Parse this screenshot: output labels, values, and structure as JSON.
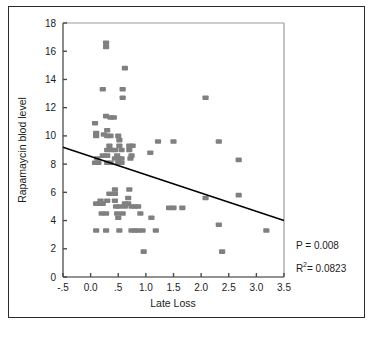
{
  "figure": {
    "frame_color": "#2b2b2b",
    "background": "#ffffff"
  },
  "chart_data": {
    "type": "scatter",
    "title": "",
    "xlabel": "Late Loss",
    "ylabel": "Rapamaycin blod level",
    "xlim": [
      -0.5,
      3.5
    ],
    "ylim": [
      0,
      18
    ],
    "grid": false,
    "legend": null,
    "marker_color": "#808080",
    "marker_shape": "square",
    "xticks": [
      -0.5,
      0.0,
      0.5,
      1.0,
      1.5,
      2.0,
      2.5,
      3.0,
      3.5
    ],
    "xtick_labels": [
      "-.5",
      "0.0",
      ".5",
      "1.0",
      "1.5",
      "2.0",
      "2.5",
      "3.0",
      "3.5"
    ],
    "yticks": [
      0,
      2,
      4,
      6,
      8,
      10,
      12,
      14,
      16,
      18
    ],
    "ytick_labels": [
      "0",
      "2",
      "4",
      "6",
      "8",
      "10",
      "12",
      "14",
      "16",
      "18"
    ],
    "points": [
      [
        0.28,
        16.6
      ],
      [
        0.28,
        16.3
      ],
      [
        0.62,
        14.8
      ],
      [
        0.22,
        13.3
      ],
      [
        0.58,
        13.3
      ],
      [
        0.58,
        12.7
      ],
      [
        2.08,
        12.7
      ],
      [
        0.28,
        11.4
      ],
      [
        0.36,
        11.3
      ],
      [
        0.42,
        11.3
      ],
      [
        0.08,
        10.9
      ],
      [
        0.3,
        10.4
      ],
      [
        0.1,
        10.2
      ],
      [
        0.24,
        10.1
      ],
      [
        0.1,
        10.0
      ],
      [
        0.3,
        10.0
      ],
      [
        0.36,
        10.0
      ],
      [
        0.5,
        10.0
      ],
      [
        0.52,
        9.7
      ],
      [
        1.22,
        9.6
      ],
      [
        1.5,
        9.6
      ],
      [
        2.32,
        9.6
      ],
      [
        0.34,
        9.3
      ],
      [
        0.52,
        9.3
      ],
      [
        0.7,
        9.3
      ],
      [
        0.76,
        9.3
      ],
      [
        0.3,
        9.0
      ],
      [
        0.38,
        9.0
      ],
      [
        0.44,
        9.0
      ],
      [
        0.56,
        9.0
      ],
      [
        0.7,
        9.0
      ],
      [
        1.08,
        8.8
      ],
      [
        0.22,
        8.6
      ],
      [
        0.3,
        8.6
      ],
      [
        0.48,
        8.6
      ],
      [
        0.74,
        8.6
      ],
      [
        0.12,
        8.4
      ],
      [
        0.44,
        8.4
      ],
      [
        0.52,
        8.4
      ],
      [
        0.56,
        8.4
      ],
      [
        0.72,
        8.4
      ],
      [
        2.68,
        8.3
      ],
      [
        0.08,
        8.1
      ],
      [
        0.14,
        8.1
      ],
      [
        0.3,
        8.1
      ],
      [
        0.36,
        8.1
      ],
      [
        0.5,
        8.1
      ],
      [
        0.56,
        8.1
      ],
      [
        0.44,
        6.2
      ],
      [
        0.7,
        6.2
      ],
      [
        0.34,
        5.9
      ],
      [
        0.44,
        5.9
      ],
      [
        2.68,
        5.8
      ],
      [
        0.68,
        5.6
      ],
      [
        2.08,
        5.6
      ],
      [
        0.18,
        5.4
      ],
      [
        0.3,
        5.4
      ],
      [
        0.44,
        5.4
      ],
      [
        0.1,
        5.2
      ],
      [
        0.16,
        5.2
      ],
      [
        0.22,
        5.2
      ],
      [
        0.62,
        5.2
      ],
      [
        0.68,
        5.2
      ],
      [
        0.46,
        5.0
      ],
      [
        0.52,
        5.0
      ],
      [
        0.62,
        5.0
      ],
      [
        0.74,
        5.0
      ],
      [
        0.8,
        5.0
      ],
      [
        0.86,
        5.0
      ],
      [
        1.42,
        4.9
      ],
      [
        1.5,
        4.9
      ],
      [
        1.66,
        4.9
      ],
      [
        0.2,
        4.5
      ],
      [
        0.28,
        4.5
      ],
      [
        0.48,
        4.5
      ],
      [
        0.58,
        4.5
      ],
      [
        0.9,
        4.5
      ],
      [
        1.1,
        4.2
      ],
      [
        0.5,
        4.2
      ],
      [
        2.32,
        3.7
      ],
      [
        0.1,
        3.3
      ],
      [
        0.28,
        3.3
      ],
      [
        0.52,
        3.3
      ],
      [
        0.74,
        3.3
      ],
      [
        0.8,
        3.3
      ],
      [
        1.18,
        3.3
      ],
      [
        3.18,
        3.3
      ],
      [
        0.86,
        3.3
      ],
      [
        0.94,
        3.3
      ],
      [
        0.96,
        1.8
      ],
      [
        2.38,
        1.8
      ]
    ],
    "fit_line": {
      "type": "linear",
      "x0": -0.5,
      "y0": 9.2,
      "x1": 3.5,
      "y1": 4.0,
      "color": "#000000"
    },
    "annotations": [
      {
        "text": "P = 0.008",
        "x": 0.82,
        "y": 0.2
      },
      {
        "text_prefix": "R",
        "text_sup": "2",
        "text_suffix": " = 0.0823",
        "x": 0.82,
        "y": 0.09
      }
    ]
  },
  "annotations_text": {
    "p_value": "P = 0.008",
    "r_squared_prefix": "R",
    "r_squared_sup": "2",
    "r_squared_value": " = 0.0823"
  }
}
